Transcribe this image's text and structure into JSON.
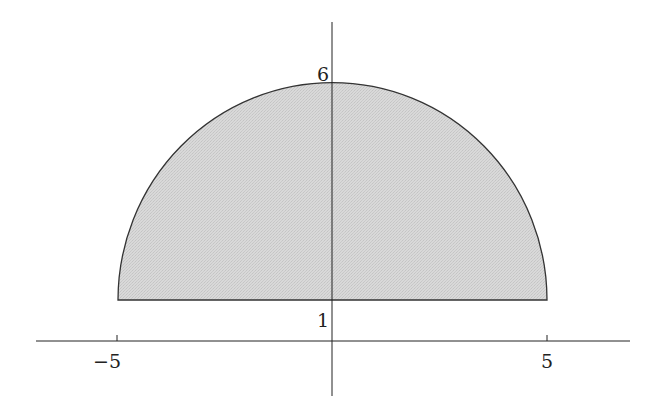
{
  "figure": {
    "region": {
      "shape": "semicircle",
      "center": [
        0,
        1
      ],
      "radius": 5,
      "fill_color": "#d6d6d6",
      "stroke_color": "#333333"
    },
    "axes": {
      "x_ticks": [
        {
          "value": -5,
          "label": "−5"
        },
        {
          "value": 5,
          "label": "5"
        }
      ],
      "y_ticks": [
        {
          "value": 1,
          "label": "1"
        },
        {
          "value": 6,
          "label": "6"
        }
      ],
      "axis_color": "#222222"
    }
  }
}
